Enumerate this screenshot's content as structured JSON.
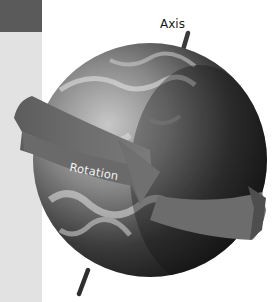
{
  "diagram": {
    "labels": {
      "axis": "Axis",
      "rotation": "Rotation"
    },
    "elements": [
      "globe",
      "axis-rod",
      "rotation-arrow"
    ],
    "colors": {
      "band_dark": "#5a5a5a",
      "band_light": "#e2e2e2",
      "arrow": "#6a6a6a",
      "axis_rod": "#3a3a3a",
      "globe_dark": "#1e1e1e",
      "globe_light": "#bdbdbd"
    }
  }
}
